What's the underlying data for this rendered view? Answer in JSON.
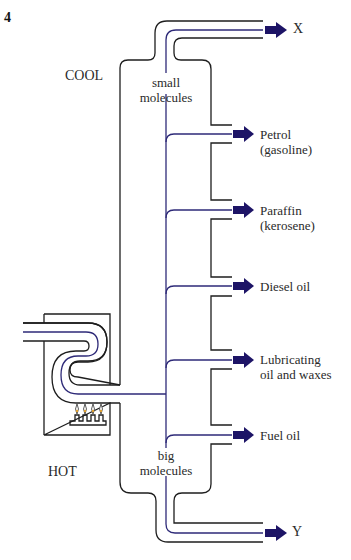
{
  "question_number": "4",
  "labels": {
    "cool": "COOL",
    "hot": "HOT",
    "top_note_line1": "small",
    "top_note_line2": "molecules",
    "bottom_note_line1": "big",
    "bottom_note_line2": "molecules",
    "top_product": "X",
    "bottom_product": "Y"
  },
  "fractions": [
    {
      "line1": "Petrol",
      "line2": "(gasoline)",
      "y": 134
    },
    {
      "line1": "Paraffin",
      "line2": "(kerosene)",
      "y": 210
    },
    {
      "line1": "Diesel oil",
      "line2": "",
      "y": 286
    },
    {
      "line1": "Lubricating",
      "line2": "oil and waxes",
      "y": 360
    },
    {
      "line1": "Fuel oil",
      "line2": "",
      "y": 435
    }
  ],
  "components": {
    "furnace": "furnace with burner",
    "column": "fractionating column"
  },
  "colors": {
    "wall": "#1e1e1e",
    "flow": "#2e2a78",
    "arrow": "#1d1466"
  }
}
